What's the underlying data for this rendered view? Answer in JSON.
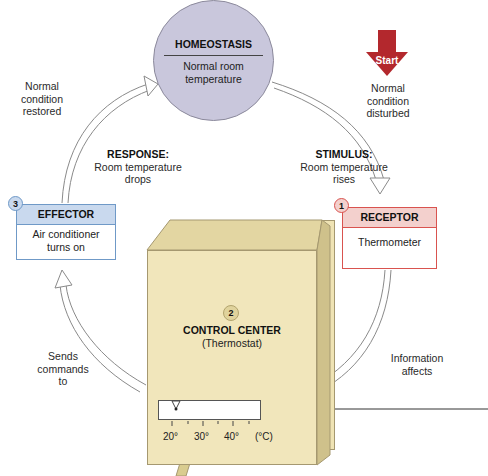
{
  "diagram": {
    "center": {
      "title": "HOMEOSTASIS",
      "subtitle_line1": "Normal room",
      "subtitle_line2": "temperature",
      "color": "#c9c7dc"
    },
    "start": {
      "label": "Start",
      "color": "#b3282d"
    },
    "labels": {
      "disturbed": [
        "Normal",
        "condition",
        "disturbed"
      ],
      "restored": [
        "Normal",
        "condition",
        "restored"
      ],
      "stimulus_title": "STIMULUS:",
      "stimulus_text": [
        "Room temperature",
        "rises"
      ],
      "response_title": "RESPONSE:",
      "response_text": [
        "Room temperature",
        "drops"
      ],
      "sends": [
        "Sends",
        "commands",
        "to"
      ],
      "information": [
        "Information",
        "affects"
      ]
    },
    "receptor": {
      "number": "1",
      "title": "RECEPTOR",
      "body": "Thermometer",
      "color": "#d9534f",
      "header_fill": "#f3d0cd"
    },
    "control_center": {
      "number": "2",
      "title": "CONTROL CENTER",
      "body": "(Thermostat)",
      "color": "#f1e6bb"
    },
    "effector": {
      "number": "3",
      "title": "EFFECTOR",
      "body_line1": "Air conditioner",
      "body_line2": "turns on",
      "color": "#6f99c7",
      "header_fill": "#c9d9ee"
    },
    "dial": {
      "ticks": [
        "20°",
        "30°",
        "40°",
        "(°C)"
      ]
    }
  }
}
